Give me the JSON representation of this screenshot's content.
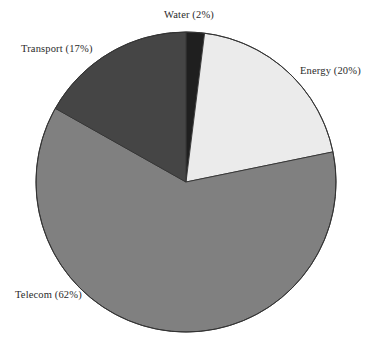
{
  "chart_data": {
    "type": "pie",
    "title": "",
    "subtitle": "",
    "xlabel": "",
    "ylabel": "",
    "legend_position": "none",
    "grid": false,
    "labels_inline": true,
    "start_angle_deg": 0,
    "direction": "clockwise",
    "categories": [
      "Water",
      "Energy",
      "Telecom",
      "Transport"
    ],
    "values": [
      2,
      20,
      62,
      17
    ],
    "units": "percent",
    "slices": [
      {
        "name": "Water",
        "value": 2,
        "label": "Water (2%)",
        "color": "#1f1f1f",
        "order": 1
      },
      {
        "name": "Energy",
        "value": 20,
        "label": "Energy (20%)",
        "color": "#ebebeb",
        "order": 2
      },
      {
        "name": "Telecom",
        "value": 62,
        "label": "Telecom (62%)",
        "color": "#808080",
        "order": 3
      },
      {
        "name": "Transport",
        "value": 17,
        "label": "Transport (17%)",
        "color": "#454545",
        "order": 4
      }
    ]
  },
  "style": {
    "background": "#ffffff",
    "outline_color": "#333333",
    "label_color": "#2b2b2b"
  },
  "geometry": {
    "center_x": 186,
    "center_y": 182,
    "radius": 150
  }
}
